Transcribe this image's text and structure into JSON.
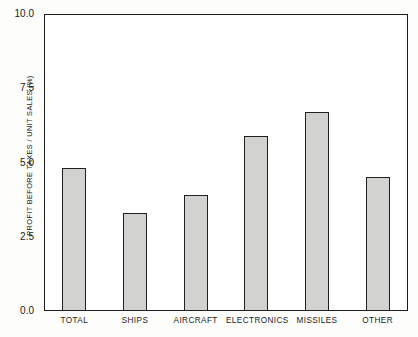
{
  "chart_data": {
    "type": "bar",
    "title": "",
    "subtitle": "",
    "xlabel": "",
    "ylabel": "PROFIT BEFORE TAXES / UNIT SALES (%)",
    "categories": [
      "TOTAL",
      "SHIPS",
      "AIRCRAFT",
      "ELECTRONICS",
      "MISSILES",
      "OTHER"
    ],
    "values": [
      4.8,
      3.3,
      3.9,
      5.9,
      6.7,
      4.5
    ],
    "ylim": [
      0.0,
      10.0
    ],
    "ytick_labels": [
      "10.0",
      "7.5",
      "5.0",
      "2.5",
      "0.0"
    ],
    "ytick_values": [
      10.0,
      7.5,
      5.0,
      2.5,
      0.0
    ],
    "grid": false,
    "legend": false,
    "legend_position": "none",
    "bar_fill_color": "#d2d2d0",
    "bar_border_color": "#20201f",
    "axis_color": "#1d1d1d",
    "plot_background": "#ffffff",
    "page_background": "#fdfdfc"
  }
}
